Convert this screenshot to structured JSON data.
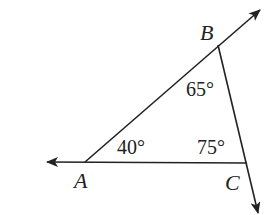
{
  "diagram": {
    "type": "triangle-with-extended-rays",
    "stroke_color": "#222222",
    "background": "#ffffff",
    "vertices": [
      {
        "id": "A",
        "label": "A",
        "x": 85,
        "y": 162
      },
      {
        "id": "B",
        "label": "B",
        "x": 218,
        "y": 45
      },
      {
        "id": "C",
        "label": "C",
        "x": 247,
        "y": 163
      }
    ],
    "rays": [
      {
        "from": "C",
        "through": "A",
        "tip": [
          47,
          162
        ]
      },
      {
        "from": "A",
        "through": "B",
        "tip": [
          260,
          10
        ]
      },
      {
        "from": "B",
        "through": "C",
        "tip": [
          258,
          213
        ]
      }
    ],
    "angles": [
      {
        "at": "A",
        "label": "40°"
      },
      {
        "at": "B",
        "label": "65°"
      },
      {
        "at": "C",
        "label": "75°"
      }
    ]
  }
}
